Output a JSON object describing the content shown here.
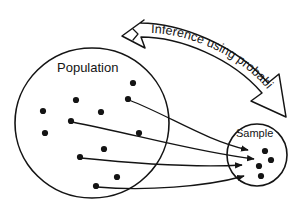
{
  "diagram": {
    "type": "statistics-inference-diagram",
    "background_color": "#ffffff",
    "ink_color": "#141414",
    "labels": {
      "population": "Population",
      "sample": "Sample",
      "banner": "Inference using probability"
    },
    "population_circle": {
      "label": "Population",
      "center_x": 92,
      "center_y": 123,
      "radius": 76,
      "dot_count": 14,
      "dots": [
        {
          "x": 133,
          "y": 83
        },
        {
          "x": 76,
          "y": 100
        },
        {
          "x": 128,
          "y": 99
        },
        {
          "x": 43,
          "y": 111
        },
        {
          "x": 101,
          "y": 112
        },
        {
          "x": 71,
          "y": 121
        },
        {
          "x": 45,
          "y": 133
        },
        {
          "x": 139,
          "y": 133
        },
        {
          "x": 104,
          "y": 149
        },
        {
          "x": 80,
          "y": 157
        },
        {
          "x": 117,
          "y": 177
        },
        {
          "x": 96,
          "y": 186
        },
        {
          "x": 62,
          "y": 144
        },
        {
          "x": 122,
          "y": 117
        }
      ]
    },
    "sample_circle": {
      "label": "Sample",
      "center_x": 257,
      "center_y": 155,
      "radius": 30,
      "dot_count": 4,
      "dots": [
        {
          "x": 265,
          "y": 151
        },
        {
          "x": 271,
          "y": 160
        },
        {
          "x": 259,
          "y": 166
        },
        {
          "x": 261,
          "y": 176
        }
      ]
    },
    "sampling_arrows": [
      {
        "from_x": 128,
        "from_y": 99,
        "to_x": 265,
        "to_y": 151
      },
      {
        "from_x": 71,
        "from_y": 121,
        "to_x": 271,
        "to_y": 160
      },
      {
        "from_x": 80,
        "from_y": 157,
        "to_x": 259,
        "to_y": 166
      },
      {
        "from_x": 96,
        "from_y": 186,
        "to_x": 261,
        "to_y": 176
      }
    ],
    "banner_arrow": {
      "text": "Inference using probability",
      "direction": "sample-to-population",
      "head_left_x": 126,
      "head_left_y": 36,
      "head_right_x": 285,
      "head_right_y": 116
    }
  }
}
